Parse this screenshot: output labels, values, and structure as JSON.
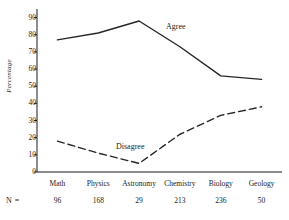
{
  "chart_data": {
    "type": "line",
    "title": "",
    "xlabel": "",
    "ylabel": "Percentage",
    "ylim": [
      0,
      95
    ],
    "yticks": [
      0,
      10,
      20,
      30,
      40,
      50,
      60,
      70,
      80,
      90
    ],
    "grid": false,
    "legend_position": "inline-annotation",
    "categories": [
      "Math",
      "Physics",
      "Astronomy",
      "Chemistry",
      "Biology",
      "Geology"
    ],
    "sample_sizes": [
      96,
      168,
      29,
      213,
      236,
      50
    ],
    "sample_size_label": "N =",
    "series": [
      {
        "name": "Agree",
        "style": "solid",
        "color": "#262626",
        "values": [
          77,
          81,
          88,
          73,
          56,
          54
        ]
      },
      {
        "name": "Disagree",
        "style": "dashed",
        "color": "#262626",
        "values": [
          18,
          11,
          5,
          22,
          33,
          38
        ]
      }
    ]
  },
  "axis": {
    "y_title": "Percentage",
    "y_tick_labels": [
      "90",
      "80",
      "70",
      "60",
      "50",
      "40",
      "30",
      "20",
      "10",
      "0"
    ]
  },
  "annotations": {
    "agree": "Agree",
    "disagree": "Disagree"
  },
  "footer": {
    "n_label": "N =",
    "n_values": [
      "96",
      "168",
      "29",
      "213",
      "236",
      "50"
    ],
    "caption": ""
  }
}
